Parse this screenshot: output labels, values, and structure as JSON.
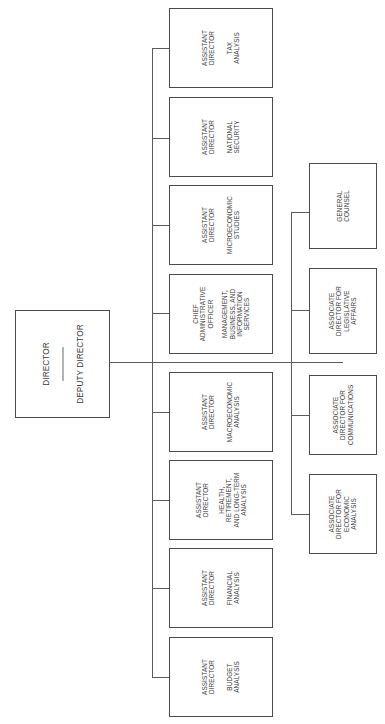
{
  "diagram": {
    "type": "organization_chart",
    "orientation": "rotated-90-ccw",
    "top": {
      "title": "DIRECTOR",
      "subtitle": "DEPUTY DIRECTOR"
    },
    "assistant_directors": [
      {
        "role": "ASSISTANT\nDIRECTOR",
        "unit": "TAX\nANALYSIS"
      },
      {
        "role": "ASSISTANT\nDIRECTOR",
        "unit": "NATIONAL\nSECURITY"
      },
      {
        "role": "ASSISTANT\nDIRECTOR",
        "unit": "MICROECONOMIC\nSTUDIES"
      },
      {
        "role": "CHIEF\nADMINISTRATIVE\nOFFICER",
        "unit": "MANAGEMENT,\nBUSINESS, AND\nINFORMATION\nSERVICES"
      },
      {
        "role": "ASSISTANT\nDIRECTOR",
        "unit": "MACROECONOMIC\nANALYSIS"
      },
      {
        "role": "ASSISTANT\nDIRECTOR",
        "unit": "HEALTH,\nRETIREMENT,\nAND LONG-TERM\nANALYSIS"
      },
      {
        "role": "ASSISTANT\nDIRECTOR",
        "unit": "FINANCIAL\nANALYSIS"
      },
      {
        "role": "ASSISTANT\nDIRECTOR",
        "unit": "BUDGET\nANALYSIS"
      }
    ],
    "associate_offices": [
      {
        "label": "GENERAL\nCOUNSEL"
      },
      {
        "label": "ASSOCIATE\nDIRECTOR FOR\nLEGISLATIVE\nAFFAIRS"
      },
      {
        "label": "ASSOCIATE\nDIRECTOR FOR\nCOMMUNICATIONS"
      },
      {
        "label": "ASSOCIATE\nDIRECTOR FOR\nECONOMIC\nANALYSIS"
      }
    ]
  }
}
